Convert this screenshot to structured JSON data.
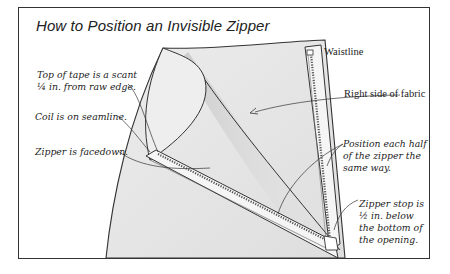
{
  "title": "How to Position an Invisible Zipper",
  "colors": {
    "frame": "#333333",
    "fabric": "#e6e6e6",
    "fabric_shadow": "#c8c8c8",
    "zipper_tape": "#f4f4f4",
    "ink": "#222222"
  },
  "labels": {
    "top_of_tape": {
      "line1": "Top of tape is a scant",
      "line2": "¼ in. from raw edge."
    },
    "coil": "Coil is on seamline.",
    "facedown": "Zipper is facedown.",
    "waistline": "Waistline",
    "right_side": "Right side of fabric",
    "position_each_half": {
      "line1": "Position each half",
      "line2": "of the zipper the",
      "line3": "same way."
    },
    "zipper_stop": {
      "line1": "Zipper stop is",
      "line2": "½ in. below",
      "line3": "the bottom of",
      "line4": "the opening."
    }
  }
}
